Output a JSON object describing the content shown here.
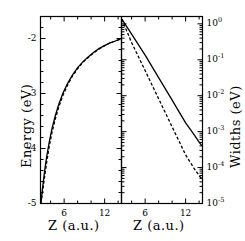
{
  "figure": {
    "axes": {
      "left_panel": {
        "ylabel": "Energy (eV)",
        "xlabel": "Z (a.u.)",
        "ytick_labels": [
          "-2",
          "-3",
          "-4",
          "-5"
        ],
        "xtick_labels": [
          "6",
          "12"
        ]
      },
      "right_panel": {
        "ylabel": "Widths (eV)",
        "xlabel": "Z (a.u.)",
        "ytick_labels": [
          "10",
          "10",
          "10",
          "10",
          "10",
          "10"
        ],
        "ytick_exponents": [
          "0",
          "-1",
          "-2",
          "-3",
          "-4",
          "-5"
        ],
        "xtick_labels": [
          "6",
          "12"
        ]
      }
    }
  },
  "chart_data": [
    {
      "type": "line",
      "title": "",
      "xlabel": "Z (a.u.)",
      "ylabel": "Energy (eV)",
      "xlim": [
        2.5,
        14.5
      ],
      "ylim": [
        -5,
        -1.6
      ],
      "yscale": "linear",
      "xticks": [
        6,
        12
      ],
      "yticks": [
        -2,
        -3,
        -4,
        -5
      ],
      "grid": false,
      "legend": "none",
      "series": [
        {
          "name": "energy-solid",
          "style": "solid",
          "color": "#000000",
          "x": [
            2.55,
            2.8,
            3.1,
            3.4,
            3.8,
            4.2,
            4.7,
            5.2,
            5.8,
            6.5,
            7.2,
            8.0,
            8.8,
            9.6,
            10.4,
            11.2,
            12.0,
            12.8,
            13.5,
            14.1,
            14.45
          ],
          "y": [
            -5.0,
            -4.72,
            -4.42,
            -4.16,
            -3.88,
            -3.64,
            -3.4,
            -3.2,
            -3.0,
            -2.82,
            -2.67,
            -2.53,
            -2.42,
            -2.33,
            -2.25,
            -2.18,
            -2.13,
            -2.08,
            -2.05,
            -2.02,
            -2.0
          ]
        },
        {
          "name": "energy-dashed",
          "style": "dashed",
          "color": "#000000",
          "x": [
            2.55,
            2.8,
            3.1,
            3.4,
            3.8,
            4.2,
            4.7,
            5.2,
            5.8,
            6.5,
            7.2,
            8.0,
            8.8,
            9.6,
            10.4,
            11.2,
            12.0,
            12.8,
            13.5,
            14.1,
            14.45
          ],
          "y": [
            -5.0,
            -4.8,
            -4.52,
            -4.26,
            -3.96,
            -3.71,
            -3.46,
            -3.25,
            -3.04,
            -2.85,
            -2.69,
            -2.55,
            -2.43,
            -2.34,
            -2.26,
            -2.19,
            -2.13,
            -2.08,
            -2.05,
            -2.02,
            -2.0
          ]
        }
      ]
    },
    {
      "type": "line",
      "title": "",
      "xlabel": "Z (a.u.)",
      "ylabel": "Widths (eV)",
      "xlim": [
        2.5,
        14.5
      ],
      "ylim": [
        1e-05,
        1.6
      ],
      "yscale": "log",
      "xticks": [
        6,
        12
      ],
      "yticks": [
        1,
        0.1,
        0.01,
        0.001,
        0.0001,
        1e-05
      ],
      "grid": false,
      "legend": "none",
      "series": [
        {
          "name": "widths-solid",
          "style": "solid",
          "color": "#000000",
          "x": [
            2.55,
            4.0,
            6.0,
            8.0,
            10.0,
            12.0,
            13.2,
            14.1,
            14.45
          ],
          "y": [
            1.35,
            0.52,
            0.135,
            0.032,
            0.0075,
            0.00175,
            0.00085,
            0.00048,
            0.0004
          ]
        },
        {
          "name": "widths-dashed",
          "style": "dashed",
          "color": "#000000",
          "x": [
            2.55,
            4.0,
            6.0,
            8.0,
            10.0,
            12.0,
            13.2,
            14.1,
            14.45
          ],
          "y": [
            1.35,
            0.3,
            0.05,
            0.0082,
            0.00135,
            0.000225,
            9.85e-05,
            5.65e-05,
            4.9e-05
          ]
        }
      ]
    }
  ]
}
